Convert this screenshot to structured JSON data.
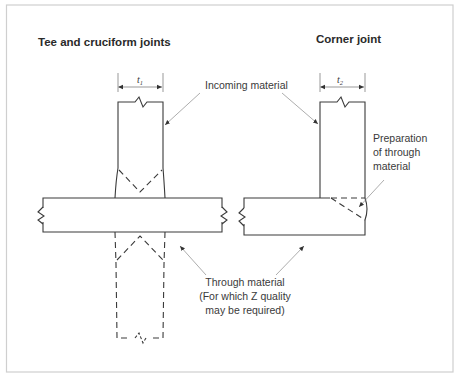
{
  "titles": {
    "left": "Tee and cruciform joints",
    "right": "Corner joint"
  },
  "dimensions": {
    "left_thickness": "t",
    "left_subscript": "1",
    "right_thickness": "t",
    "right_subscript": "2"
  },
  "labels": {
    "incoming_material": "Incoming material",
    "preparation_line1": "Preparation",
    "preparation_line2": "of through",
    "preparation_line3": "material",
    "through_line1": "Through material",
    "through_line2": "(For which Z quality",
    "through_line3": "may be required)"
  },
  "colors": {
    "line": "#3a3a3a",
    "frame": "#cfcfcf",
    "leader": "#8a8a8a"
  }
}
